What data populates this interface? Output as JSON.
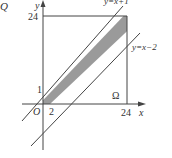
{
  "diagram": {
    "corner_label": "Q",
    "axes": {
      "x_label": "x",
      "y_label": "y",
      "origin_label": "O"
    },
    "ticks": {
      "x": [
        "2",
        "24"
      ],
      "y": [
        "1",
        "24"
      ]
    },
    "lines": [
      {
        "label": "y=x+1"
      },
      {
        "label": "y=x−2"
      }
    ],
    "region_label": "Ω",
    "colors": {
      "shade": "#9a9a9a",
      "stroke": "#444444"
    }
  }
}
